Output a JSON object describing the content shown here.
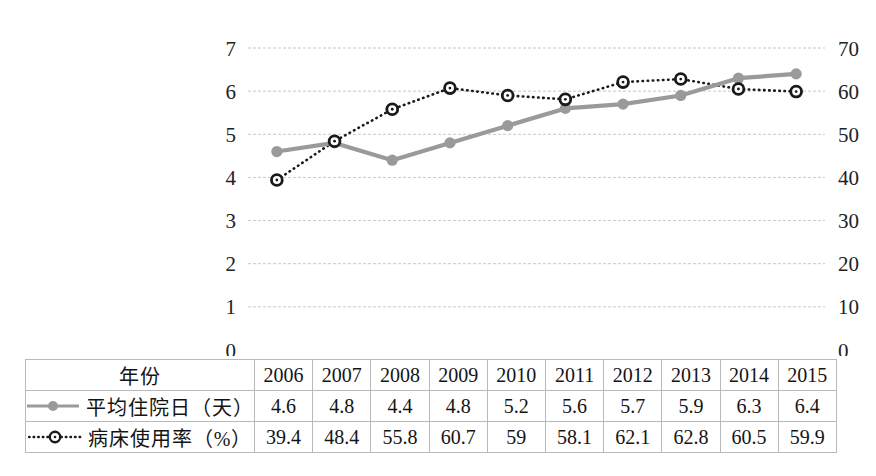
{
  "chart_data": {
    "type": "line",
    "title": "",
    "xlabel": "",
    "categories": [
      "2006",
      "2007",
      "2008",
      "2009",
      "2010",
      "2011",
      "2012",
      "2013",
      "2014",
      "2015"
    ],
    "grid": true,
    "legend_position": "table-row-labels",
    "axes": {
      "left": {
        "label": "平均住院日（天）",
        "ylim": [
          0,
          7
        ],
        "ticks": [
          "0",
          "1",
          "2",
          "3",
          "4",
          "5",
          "6",
          "7"
        ],
        "tick_values": [
          0,
          1,
          2,
          3,
          4,
          5,
          6,
          7
        ]
      },
      "right": {
        "label": "病床使用率（%）",
        "ylim": [
          0,
          70
        ],
        "ticks": [
          "0",
          "10",
          "20",
          "30",
          "40",
          "50",
          "60",
          "70"
        ],
        "tick_values": [
          0,
          10,
          20,
          30,
          40,
          50,
          60,
          70
        ]
      }
    },
    "series": [
      {
        "name": "平均住院日（天）",
        "axis": "left",
        "style": "solid",
        "color": "#9a9a9a",
        "marker": "filled-circle",
        "values": [
          4.6,
          4.8,
          4.4,
          4.8,
          5.2,
          5.6,
          5.7,
          5.9,
          6.3,
          6.4
        ]
      },
      {
        "name": "病床使用率（%）",
        "axis": "right",
        "style": "dotted",
        "color": "#1a1a1a",
        "marker": "donut-circle",
        "values": [
          39.4,
          48.4,
          55.8,
          60.7,
          59,
          58.1,
          62.1,
          62.8,
          60.5,
          59.9
        ]
      }
    ]
  },
  "table": {
    "header_label": "年份",
    "years": [
      "2006",
      "2007",
      "2008",
      "2009",
      "2010",
      "2011",
      "2012",
      "2013",
      "2014",
      "2015"
    ],
    "rows": [
      {
        "label": "平均住院日（天）",
        "marker": "solid-line-filled-circle",
        "values": [
          "4.6",
          "4.8",
          "4.4",
          "4.8",
          "5.2",
          "5.6",
          "5.7",
          "5.9",
          "6.3",
          "6.4"
        ]
      },
      {
        "label": "病床使用率（%）",
        "marker": "dotted-line-donut-circle",
        "values": [
          "39.4",
          "48.4",
          "55.8",
          "60.7",
          "59",
          "58.1",
          "62.1",
          "62.8",
          "60.5",
          "59.9"
        ]
      }
    ]
  },
  "colors": {
    "series_days": "#9a9a9a",
    "series_rate": "#1a1a1a",
    "gridline": "#c8c8c8",
    "table_border": "#b9b9b9"
  }
}
